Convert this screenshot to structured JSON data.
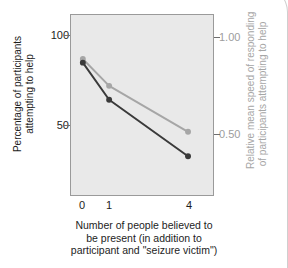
{
  "chart_data": {
    "type": "line",
    "title": "",
    "xlabel_lines": [
      "Number of people believed to",
      "be present (in addition to",
      "participant and \"seizure victim\")"
    ],
    "xlabel": "Number of people believed to be present (in addition to participant and \"seizure victim\")",
    "x": [
      0,
      1,
      4
    ],
    "xtick_labels": [
      "0",
      "1",
      "4"
    ],
    "xlim": [
      -0.45,
      4.95
    ],
    "grid": false,
    "legend": "none",
    "axes": [
      {
        "id": "left",
        "ylabel_lines": [
          "Percentage of participants",
          "attempting to help"
        ],
        "ylabel": "Percentage of participants attempting to help",
        "ytick_labels": [
          "100",
          "50"
        ],
        "ytick_values": [
          100,
          50
        ],
        "ylim": [
          10,
          112
        ],
        "color": "#3a3a3a"
      },
      {
        "id": "right",
        "ylabel_lines": [
          "Relative mean speed of responding",
          "of participants attempting to help"
        ],
        "ylabel": "Relative mean speed of responding of participants attempting to help",
        "ytick_labels": [
          "1.00",
          "0.50"
        ],
        "ytick_values": [
          1.0,
          0.5
        ],
        "ylim": [
          0.18,
          1.12
        ],
        "color": "#a6a6a6"
      }
    ],
    "series": [
      {
        "name": "Percentage of participants attempting to help",
        "axis": "left",
        "color": "#3a3a3a",
        "marker": "circle",
        "values": [
          85,
          64,
          32
        ]
      },
      {
        "name": "Relative mean speed of responding of participants attempting to help",
        "axis": "right",
        "color": "#a6a6a6",
        "marker": "circle",
        "values": [
          0.89,
          0.75,
          0.51
        ]
      }
    ]
  },
  "colors": {
    "plot_background": "#e9e9e9",
    "frame": "#9a9a9a",
    "dark_series": "#3a3a3a",
    "light_series": "#a6a6a6",
    "text": "#1d1d1d",
    "muted_text": "#a6a6a6"
  }
}
